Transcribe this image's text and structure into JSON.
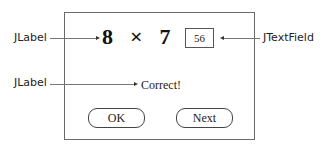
{
  "window": {
    "equation": {
      "operand_a": "8",
      "operator": "×",
      "operand_b": "7",
      "equals": "="
    },
    "answer_field": {
      "value": "56"
    },
    "result_label": "Correct!",
    "buttons": {
      "ok": "OK",
      "next": "Next"
    }
  },
  "annotations": {
    "equation_label": "JLabel",
    "textfield_label": "JTextField",
    "result_label": "JLabel"
  },
  "colors": {
    "frame_border": "#6a6a6a",
    "text": "#111111",
    "leader_line": "#777777"
  }
}
